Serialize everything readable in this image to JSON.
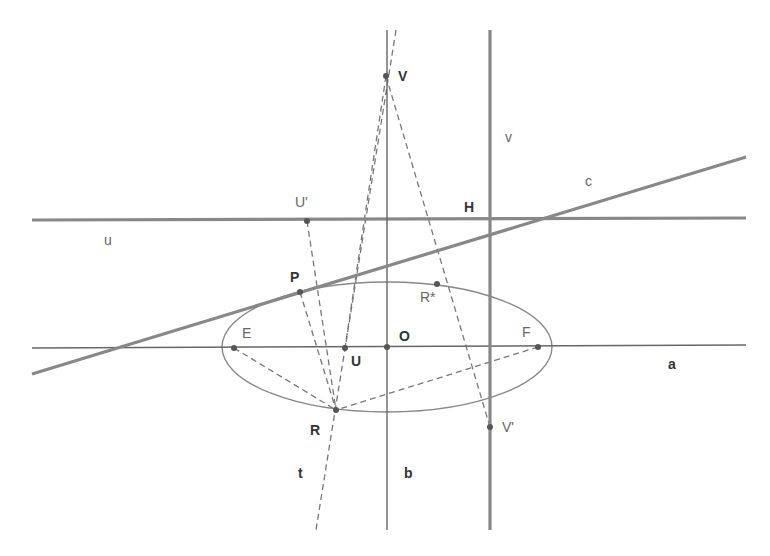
{
  "figure": {
    "colors": {
      "background": "#ffffff",
      "thick_line": "#888888",
      "thin_line": "#666666",
      "ellipse": "#888888",
      "dashed": "#777777",
      "point": "#555555",
      "label": "#444444"
    }
  },
  "lines": [
    {
      "id": "u",
      "label": "u",
      "kind": "thick",
      "x1": 32,
      "y1": 220,
      "x2": 746,
      "y2": 218,
      "label_x": 104,
      "label_y": 245
    },
    {
      "id": "a",
      "label": "a",
      "kind": "thin",
      "x1": 32,
      "y1": 348,
      "x2": 746,
      "y2": 345,
      "label_x": 668,
      "label_y": 369
    },
    {
      "id": "b",
      "label": "b",
      "kind": "thin",
      "x1": 387,
      "y1": 30,
      "x2": 387,
      "y2": 530,
      "label_x": 404,
      "label_y": 478
    },
    {
      "id": "v",
      "label": "v",
      "kind": "thick",
      "x1": 490,
      "y1": 30,
      "x2": 490,
      "y2": 530,
      "label_x": 505,
      "label_y": 142
    },
    {
      "id": "c",
      "label": "c",
      "kind": "thick",
      "x1": 32,
      "y1": 374,
      "x2": 746,
      "y2": 157,
      "label_x": 585,
      "label_y": 186
    }
  ],
  "dashed_lines": [
    {
      "id": "t",
      "label": "t",
      "x1": 396,
      "y1": 30,
      "x2": 316,
      "y2": 530,
      "label_x": 298,
      "label_y": 478
    },
    {
      "id": "V-U",
      "x1": 386,
      "y1": 76,
      "x2": 345,
      "y2": 348
    },
    {
      "id": "V-Vprime",
      "x1": 386,
      "y1": 76,
      "x2": 490,
      "y2": 427
    },
    {
      "id": "Uprime-R",
      "x1": 307,
      "y1": 221,
      "x2": 336,
      "y2": 410
    },
    {
      "id": "E-R",
      "x1": 234,
      "y1": 348,
      "x2": 336,
      "y2": 410
    },
    {
      "id": "F-R",
      "x1": 538,
      "y1": 347,
      "x2": 336,
      "y2": 410
    },
    {
      "id": "P-R",
      "x1": 300,
      "y1": 292,
      "x2": 336,
      "y2": 410
    }
  ],
  "ellipse": {
    "cx": 387,
    "cy": 347,
    "rx": 165,
    "ry": 65
  },
  "points": [
    {
      "id": "V",
      "label": "V",
      "x": 386,
      "y": 76,
      "label_dx": 12,
      "label_dy": 5,
      "style": "bold"
    },
    {
      "id": "H",
      "label": "H",
      "x": 490,
      "y": 219,
      "label_dx": -26,
      "label_dy": -7,
      "style": "bold",
      "hide_dot": true
    },
    {
      "id": "U'",
      "label": "U'",
      "x": 307,
      "y": 221,
      "label_dx": -12,
      "label_dy": -14,
      "style": "light"
    },
    {
      "id": "P",
      "label": "P",
      "x": 300,
      "y": 292,
      "label_dx": -10,
      "label_dy": -10,
      "style": "bold"
    },
    {
      "id": "R*",
      "label": "R*",
      "x": 437,
      "y": 284,
      "label_dx": -17,
      "label_dy": 18,
      "style": "light"
    },
    {
      "id": "E",
      "label": "E",
      "x": 234,
      "y": 348,
      "label_dx": 8,
      "label_dy": -10,
      "style": "light"
    },
    {
      "id": "U",
      "label": "U",
      "x": 345,
      "y": 348,
      "label_dx": 6,
      "label_dy": 18,
      "style": "bold"
    },
    {
      "id": "O",
      "label": "O",
      "x": 387,
      "y": 347,
      "label_dx": 12,
      "label_dy": -6,
      "style": "bold"
    },
    {
      "id": "F",
      "label": "F",
      "x": 538,
      "y": 347,
      "label_dx": -16,
      "label_dy": -10,
      "style": "light"
    },
    {
      "id": "R",
      "label": "R",
      "x": 336,
      "y": 410,
      "label_dx": -26,
      "label_dy": 25,
      "style": "bold"
    },
    {
      "id": "V'",
      "label": "V'",
      "x": 490,
      "y": 427,
      "label_dx": 12,
      "label_dy": 5,
      "style": "light"
    }
  ],
  "caption_fragment": "g                                                              ,"
}
